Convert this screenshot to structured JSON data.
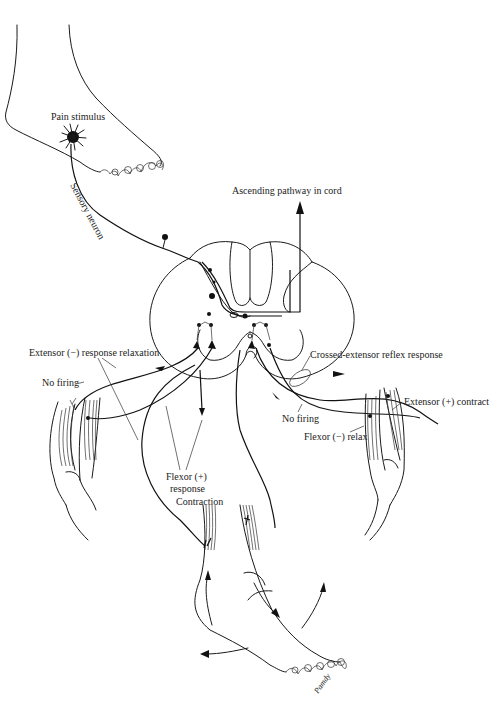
{
  "diagram": {
    "labels": {
      "pain_stimulus": "Pain stimulus",
      "sensory_neuron": "Sensory neuron",
      "ascending_pathway": "Ascending pathway in cord",
      "extensor_relax": "Extensor (−) response relaxation",
      "no_firing_left": "No firing",
      "crossed_extensor": "Crossed-extensor reflex response",
      "no_firing_right": "No firing",
      "flexor_relax": "Flexor (−) relax",
      "extensor_contract": "Extensor (+) contract",
      "flexor_response_line1": "Flexor (+)",
      "flexor_response_line2": "response",
      "contraction": "Contraction",
      "signature": "Pamdy"
    },
    "parts": [
      "foot-with-stimulus",
      "spinal-cord-cross-section",
      "left-thigh-muscles",
      "right-thigh-muscles",
      "lower-leg-and-foot"
    ],
    "colors": {
      "ink": "#1a1a1a",
      "background": "#ffffff"
    }
  }
}
